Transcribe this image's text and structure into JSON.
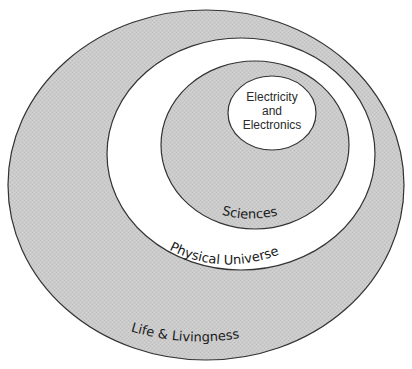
{
  "diagram": {
    "type": "nested-venn",
    "colors": {
      "background": "#ffffff",
      "gray_fill": "#c9c9c9",
      "white_fill": "#ffffff",
      "stroke": "#333333"
    },
    "regions": [
      {
        "id": "life",
        "label": "Life & Livingness",
        "fill": "gray"
      },
      {
        "id": "physical",
        "label": "Physical Universe",
        "fill": "white"
      },
      {
        "id": "sciences",
        "label": "Sciences",
        "fill": "gray"
      },
      {
        "id": "electricity",
        "label_lines": [
          "Electricity",
          "and",
          "Electronics"
        ],
        "fill": "white"
      }
    ]
  }
}
